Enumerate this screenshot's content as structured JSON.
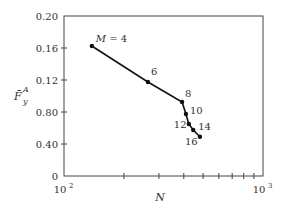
{
  "chart_data": {
    "type": "line",
    "title": "",
    "xlabel": "N",
    "ylabel": "F̄_y^A",
    "xscale": "log",
    "xlim": [
      100,
      1000
    ],
    "ylim": [
      0,
      0.2
    ],
    "x_tick_labels": [
      {
        "value": 100,
        "label": "10",
        "exp": "2"
      },
      {
        "value": 1000,
        "label": "10",
        "exp": "3"
      }
    ],
    "x_minor_ticks": [
      200,
      300,
      400,
      500,
      600,
      700,
      800,
      900
    ],
    "y_ticks": [
      {
        "value": 0,
        "label": "0"
      },
      {
        "value": 0.04,
        "label": "0.40"
      },
      {
        "value": 0.08,
        "label": "0.80"
      },
      {
        "value": 0.12,
        "label": "0.12"
      },
      {
        "value": 0.16,
        "label": "0.16"
      },
      {
        "value": 0.2,
        "label": "0.20"
      }
    ],
    "grid": false,
    "legend": null,
    "series": [
      {
        "name": "M",
        "points": [
          {
            "M": 4,
            "label": "M = 4",
            "x": 138,
            "y": 0.1625,
            "label_dx": 4,
            "label_dy": -4
          },
          {
            "M": 6,
            "label": "6",
            "x": 264,
            "y": 0.1175,
            "label_dx": 3,
            "label_dy": -7
          },
          {
            "M": 8,
            "label": "8",
            "x": 392,
            "y": 0.0925,
            "label_dx": 3,
            "label_dy": -5
          },
          {
            "M": 10,
            "label": "10",
            "x": 410,
            "y": 0.0775,
            "label_dx": 4,
            "label_dy": 0
          },
          {
            "M": 12,
            "label": "12",
            "x": 424,
            "y": 0.065,
            "label_dx": -15,
            "label_dy": 4
          },
          {
            "M": 14,
            "label": "14",
            "x": 446,
            "y": 0.0575,
            "label_dx": 5,
            "label_dy": 0
          },
          {
            "M": 16,
            "label": "16",
            "x": 482,
            "y": 0.049,
            "label_dx": -15,
            "label_dy": 8
          }
        ]
      }
    ]
  },
  "axis": {
    "x_title": "N",
    "y_title_main": "F̄",
    "y_title_sub": "y",
    "y_title_sup": "A"
  }
}
